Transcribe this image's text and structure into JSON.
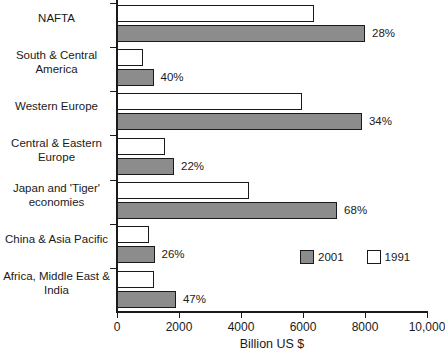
{
  "chart_data": {
    "type": "bar",
    "orientation": "horizontal",
    "title": "",
    "xlabel": "Billion US $",
    "ylabel": "",
    "xlim": [
      0,
      10000
    ],
    "grid": false,
    "legend_position": "lower-right",
    "categories": [
      "NAFTA",
      "South & Central\nAmerica",
      "Western Europe",
      "Central & Eastern\nEurope",
      "Japan and 'Tiger'\neconomies",
      "China & Asia Pacific",
      "Africa, Middle East &\nIndia"
    ],
    "series": [
      {
        "name": "1991",
        "color": "#ffffff",
        "values": [
          6350,
          830,
          5970,
          1550,
          4250,
          1030,
          1200
        ]
      },
      {
        "name": "2001",
        "color": "#8c8c8c",
        "values": [
          8000,
          1180,
          7900,
          1840,
          7100,
          1210,
          1900
        ]
      }
    ],
    "annotations": [
      "28%",
      "40%",
      "34%",
      "22%",
      "68%",
      "26%",
      "47%"
    ],
    "xticks": [
      0,
      2000,
      4000,
      6000,
      8000,
      10000
    ],
    "xticklabels": [
      "0",
      "2000",
      "4000",
      "6000",
      "8000",
      "10,000"
    ]
  },
  "legend": {
    "entries": [
      {
        "label": "2001",
        "swatch": "gray-swatch"
      },
      {
        "label": "1991",
        "swatch": "white-swatch"
      }
    ]
  }
}
